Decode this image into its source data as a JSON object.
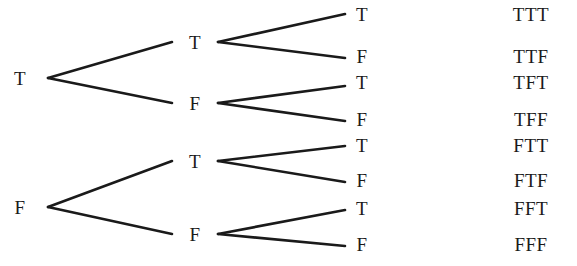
{
  "diagram": {
    "type": "binary-probability-tree",
    "title": "",
    "levels": 3,
    "ink_color": "#1a1a1a",
    "background_color": "#ffffff",
    "root": {
      "nodes": [
        {
          "id": "r-T",
          "label": "T",
          "x": 20,
          "y": 78
        },
        {
          "id": "r-F",
          "label": "F",
          "x": 20,
          "y": 207
        }
      ]
    },
    "level2": {
      "nodes": [
        {
          "id": "l2-TT",
          "label": "T",
          "x": 195,
          "y": 42
        },
        {
          "id": "l2-TF",
          "label": "F",
          "x": 195,
          "y": 103
        },
        {
          "id": "l2-FT",
          "label": "T",
          "x": 195,
          "y": 161
        },
        {
          "id": "l2-FF",
          "label": "F",
          "x": 195,
          "y": 234
        }
      ]
    },
    "level3": {
      "nodes": [
        {
          "id": "l3-1",
          "label": "T",
          "x": 362,
          "y": 14
        },
        {
          "id": "l3-2",
          "label": "F",
          "x": 362,
          "y": 56
        },
        {
          "id": "l3-3",
          "label": "T",
          "x": 362,
          "y": 82
        },
        {
          "id": "l3-4",
          "label": "F",
          "x": 362,
          "y": 119
        },
        {
          "id": "l3-5",
          "label": "T",
          "x": 362,
          "y": 145
        },
        {
          "id": "l3-6",
          "label": "F",
          "x": 362,
          "y": 180
        },
        {
          "id": "l3-7",
          "label": "T",
          "x": 362,
          "y": 208
        },
        {
          "id": "l3-8",
          "label": "F",
          "x": 362,
          "y": 244
        }
      ]
    },
    "outcomes": {
      "x": 531,
      "items": [
        {
          "id": "out-1",
          "label": "TTT",
          "y": 14
        },
        {
          "id": "out-2",
          "label": "TTF",
          "y": 56
        },
        {
          "id": "out-3",
          "label": "TFT",
          "y": 82
        },
        {
          "id": "out-4",
          "label": "TFF",
          "y": 119
        },
        {
          "id": "out-5",
          "label": "FTT",
          "y": 145
        },
        {
          "id": "out-6",
          "label": "FTF",
          "y": 180
        },
        {
          "id": "out-7",
          "label": "FFT",
          "y": 208
        },
        {
          "id": "out-8",
          "label": "FFF",
          "y": 244
        }
      ]
    },
    "edges": [
      {
        "id": "e-root-T-up",
        "from": "r-T",
        "to": "l2-TT",
        "x1": 48,
        "y1": 78,
        "x2": 172,
        "y2": 42
      },
      {
        "id": "e-root-T-down",
        "from": "r-T",
        "to": "l2-TF",
        "x1": 48,
        "y1": 78,
        "x2": 172,
        "y2": 103
      },
      {
        "id": "e-root-F-up",
        "from": "r-F",
        "to": "l2-FT",
        "x1": 48,
        "y1": 207,
        "x2": 172,
        "y2": 161
      },
      {
        "id": "e-root-F-down",
        "from": "r-F",
        "to": "l2-FF",
        "x1": 48,
        "y1": 207,
        "x2": 172,
        "y2": 234
      },
      {
        "id": "e-TT-up",
        "from": "l2-TT",
        "to": "l3-1",
        "x1": 218,
        "y1": 42,
        "x2": 345,
        "y2": 14
      },
      {
        "id": "e-TT-down",
        "from": "l2-TT",
        "to": "l3-2",
        "x1": 218,
        "y1": 42,
        "x2": 345,
        "y2": 58
      },
      {
        "id": "e-TF-up",
        "from": "l2-TF",
        "to": "l3-3",
        "x1": 218,
        "y1": 103,
        "x2": 345,
        "y2": 86
      },
      {
        "id": "e-TF-down",
        "from": "l2-TF",
        "to": "l3-4",
        "x1": 218,
        "y1": 103,
        "x2": 345,
        "y2": 121
      },
      {
        "id": "e-FT-up",
        "from": "l2-FT",
        "to": "l3-5",
        "x1": 218,
        "y1": 161,
        "x2": 345,
        "y2": 146
      },
      {
        "id": "e-FT-down",
        "from": "l2-FT",
        "to": "l3-6",
        "x1": 218,
        "y1": 161,
        "x2": 345,
        "y2": 182
      },
      {
        "id": "e-FF-up",
        "from": "l2-FF",
        "to": "l3-7",
        "x1": 218,
        "y1": 234,
        "x2": 345,
        "y2": 210
      },
      {
        "id": "e-FF-down",
        "from": "l2-FF",
        "to": "l3-8",
        "x1": 218,
        "y1": 234,
        "x2": 345,
        "y2": 246
      }
    ]
  }
}
